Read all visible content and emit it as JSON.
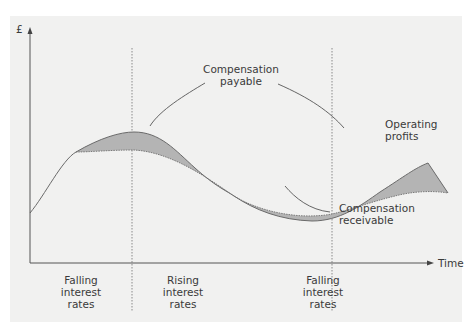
{
  "diagram": {
    "y_axis_label": "£",
    "x_axis_label": "Time",
    "annotations": {
      "compensation_payable": "Compensation\npayable",
      "operating_profits": "Operating\nprofits",
      "compensation_receivable": "Compensation\nreceivable"
    },
    "periods": [
      {
        "label": "Falling\ninterest\nrates"
      },
      {
        "label": "Rising\ninterest\nrates"
      },
      {
        "label": "Falling\ninterest\nrates"
      }
    ],
    "colors": {
      "panel_background": "#f1f1f0",
      "curve_line": "#6a6a6a",
      "fill": "#b4b4b4",
      "axis": "#555555",
      "divider": "#8a8a8a"
    }
  }
}
